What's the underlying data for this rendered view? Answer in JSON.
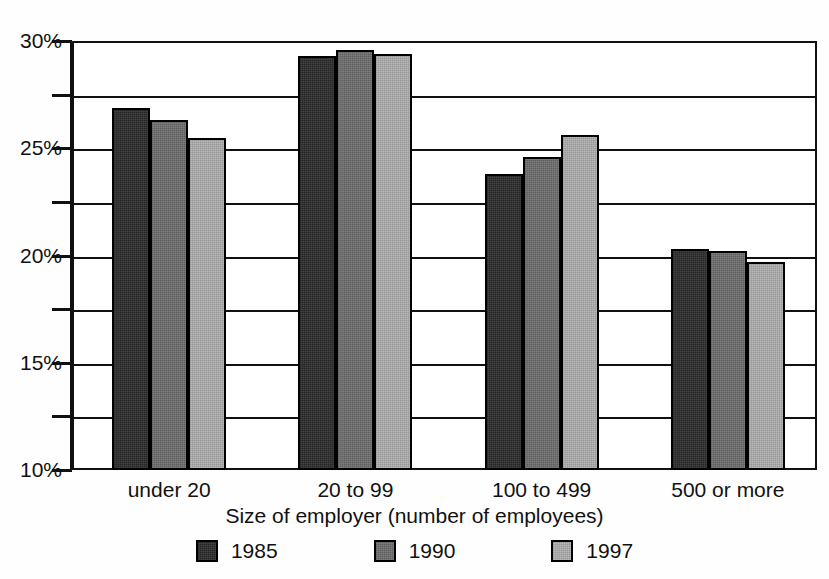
{
  "chart_data": {
    "type": "bar",
    "title": "",
    "xlabel": "Size of employer (number of employees)",
    "ylabel": "",
    "categories": [
      "under 20",
      "20 to 99",
      "100 to 499",
      "500 or more"
    ],
    "series": [
      {
        "name": "1985",
        "color": "#333333",
        "values": [
          26.9,
          29.3,
          23.8,
          20.3
        ]
      },
      {
        "name": "1990",
        "color": "#6e6e6e",
        "values": [
          26.3,
          29.6,
          24.6,
          20.2
        ]
      },
      {
        "name": "1997",
        "color": "#a9a9a9",
        "values": [
          25.5,
          29.4,
          25.6,
          19.7
        ]
      }
    ],
    "ylim": [
      10,
      30
    ],
    "ytick_labels": [
      "30%",
      "25%",
      "20%",
      "15%",
      "10%"
    ],
    "ytick_values": [
      30,
      25,
      20,
      15,
      10
    ],
    "yminor_values": [
      27.5,
      22.5,
      17.5,
      12.5
    ],
    "grid": true,
    "legend_position": "bottom",
    "legend_entries": [
      "1985",
      "1990",
      "1997"
    ]
  },
  "axis": {
    "y_labels": [
      {
        "text": "30%",
        "value": 30
      },
      {
        "text": "25%",
        "value": 25
      },
      {
        "text": "20%",
        "value": 20
      },
      {
        "text": "15%",
        "value": 15
      },
      {
        "text": "10%",
        "value": 10
      }
    ],
    "x_title": "Size of employer (number of employees)"
  },
  "legend": {
    "items": [
      {
        "label": "1985",
        "color": "#333333"
      },
      {
        "label": "1990",
        "color": "#6e6e6e"
      },
      {
        "label": "1997",
        "color": "#a9a9a9"
      }
    ]
  }
}
